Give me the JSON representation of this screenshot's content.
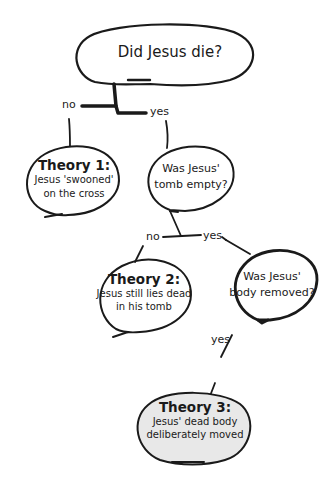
{
  "nodes": {
    "root": {
      "text": "Did Jesus die?"
    },
    "theory1": {
      "title": "Theory 1:",
      "line1": "Jesus 'swooned'",
      "line2": "on the cross"
    },
    "q_tomb": {
      "line1": "Was Jesus'",
      "line2": "tomb empty?"
    },
    "theory2": {
      "title": "Theory 2:",
      "line1": "Jesus still lies dead",
      "line2": "in his tomb"
    },
    "q_body": {
      "line1": "Was Jesus'",
      "line2": "body removed?"
    },
    "theory3": {
      "title": "Theory 3:",
      "line1": "Jesus' dead body",
      "line2": "deliberately moved"
    }
  },
  "edges": {
    "root_no": "no",
    "root_yes": "yes",
    "tomb_no": "no",
    "tomb_yes": "yes",
    "body_yes": "yes"
  },
  "colors": {
    "stroke": "#1a1a1a",
    "background": "#ffffff",
    "highlight_fill": "#e8e8e8"
  }
}
